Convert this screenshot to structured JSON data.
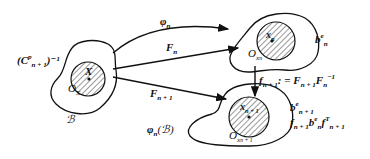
{
  "diagram": {
    "type": "continuum-mechanics-configurations",
    "colors": {
      "stroke": "#111111",
      "background": "#ffffff",
      "hatch": "#333333"
    },
    "bodies": [
      {
        "id": "reference",
        "label": "ℬ",
        "center_label": "X",
        "origin_label": "O",
        "origin_sub": "X",
        "outer_label": "(C",
        "outer_sup": "p",
        "outer_sub": "n + 1",
        "outer_tail": ")⁻¹"
      },
      {
        "id": "current_n",
        "center_label": "x",
        "center_sub": "n",
        "origin_label": "O",
        "origin_sub": "x",
        "origin_subsub": "n",
        "side_label": "b",
        "side_sup": "e",
        "side_sub": "n"
      },
      {
        "id": "current_n1",
        "label_main": "φ",
        "label_sub": "n",
        "label_tail": "(ℬ)",
        "center_label": "x",
        "center_sub": "n + 1",
        "origin_label": "O",
        "origin_sub": "x",
        "origin_subsub": "n + 1",
        "side_label": "b",
        "side_sup": "e",
        "side_sub": "n + 1",
        "push_a": "f",
        "push_a_sub": "n + 1",
        "push_b": "b",
        "push_b_sup": "e",
        "push_b_sub": "n",
        "push_c": "f",
        "push_c_sup": "T",
        "push_c_sub": "n + 1"
      }
    ],
    "arrows": [
      {
        "id": "phi_n",
        "label": "φ",
        "sub": "n"
      },
      {
        "id": "F_n",
        "label": "F",
        "sub": "n"
      },
      {
        "id": "F_n1",
        "label": "F",
        "sub": "n + 1"
      },
      {
        "id": "f_n1",
        "label": "f",
        "sub": "n + 1",
        "def": ": = ",
        "r1": "F",
        "r1_sub": "n + 1",
        "r2": "F",
        "r2_sub": "n",
        "r2_sup": "−1"
      }
    ]
  }
}
